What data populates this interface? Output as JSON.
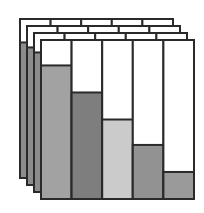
{
  "chart_data": {
    "type": "bar",
    "title": "",
    "xlabel": "",
    "ylabel": "",
    "grid": false,
    "legend": null,
    "stacked_panels": 4,
    "categories": [
      "1",
      "2",
      "3",
      "4",
      "5"
    ],
    "values": [
      84,
      67,
      50,
      34,
      17
    ],
    "ylim": [
      0,
      100
    ],
    "colors": [
      "#a2a2a2",
      "#7e7e7e",
      "#cbcbcb",
      "#929292",
      "#9a9a9a"
    ]
  },
  "style": {
    "outline": "#2a2a2a",
    "background": "#ffffff",
    "back_panel_fill": "#8c8c8c"
  }
}
